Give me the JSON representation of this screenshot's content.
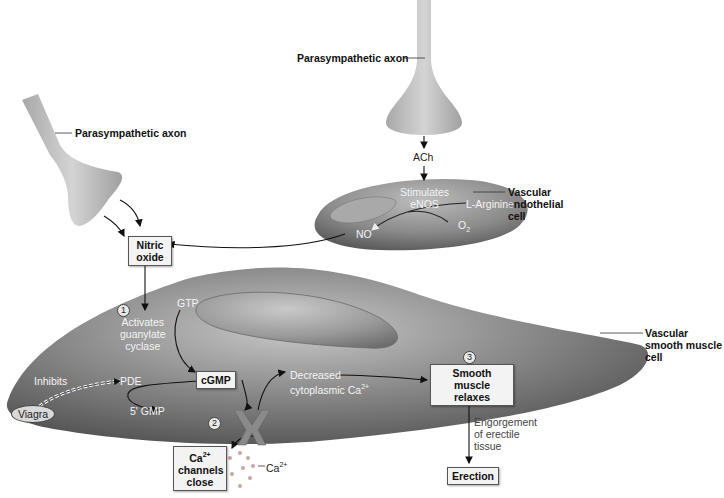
{
  "figure": {
    "top_axon": {
      "label": "Parasympathetic axon",
      "neurotransmitter": "ACh"
    },
    "left_axon": {
      "label": "Parasympathetic axon"
    },
    "endothelial_cell": {
      "label_line1": "Vascular",
      "label_line2": "endothelial",
      "label_line3": "cell",
      "stimulates_line1": "Stimulates",
      "stimulates_line2": "eNOS",
      "substrate": "L-Arginine",
      "oxygen": "O",
      "oxygen_sub": "2",
      "product": "NO"
    },
    "nitric_oxide_box": {
      "line1": "Nitric",
      "line2": "oxide"
    },
    "smooth_muscle_cell": {
      "label_line1": "Vascular",
      "label_line2": "smooth muscle",
      "label_line3": "cell"
    },
    "steps": [
      {
        "number": "1",
        "line1": "Activates",
        "line2": "guanylate",
        "line3": "cyclase"
      },
      {
        "number": "2"
      },
      {
        "number": "3"
      }
    ],
    "gtp": "GTP",
    "cgmp": "cGMP",
    "pde": "PDE",
    "five_gmp": "5' GMP",
    "inhibits": "Inhibits",
    "viagra": "Viagra",
    "decreased_ca": {
      "line1": "Decreased",
      "line2": "cytoplasmic Ca",
      "sup": "2+"
    },
    "ca_channels_box": {
      "line1": "Ca",
      "line1_sup": "2+",
      "line2": "channels",
      "line3": "close"
    },
    "ca_ion": {
      "label": "Ca",
      "sup": "2+"
    },
    "relaxes_box": {
      "line1": "Smooth muscle",
      "line2": "relaxes"
    },
    "engorgement": {
      "line1": "Engorgement",
      "line2": "of erectile",
      "line3": "tissue"
    },
    "erection_box": "Erection"
  },
  "colors": {
    "cell_dark": "#4a4a4a",
    "cell_mid": "#8a8a8a",
    "cell_light": "#b5b5b5",
    "axon": "#b8b8b8",
    "box_fill": "#f3f3f3",
    "arrow": "#111111"
  }
}
